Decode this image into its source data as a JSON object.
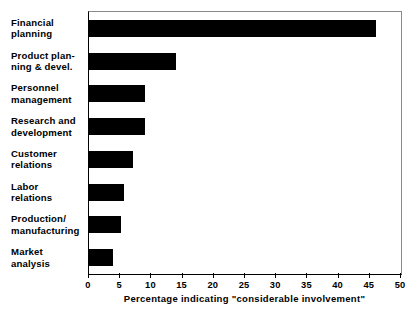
{
  "chart_data": {
    "type": "bar",
    "orientation": "horizontal",
    "title": "",
    "xlabel": "Percentage indicating \"considerable involvement\"",
    "ylabel": "",
    "xlim": [
      0,
      50
    ],
    "xticks": [
      0,
      5,
      10,
      15,
      20,
      25,
      30,
      35,
      40,
      45,
      50
    ],
    "xticklabels": [
      "0",
      "5",
      "10",
      "15",
      "20",
      "25",
      "30",
      "35",
      "40",
      "45",
      "50"
    ],
    "grid": false,
    "legend": null,
    "bar_color": "#000000",
    "background_color": "#ffffff",
    "categories": [
      "Financial\nplanning",
      "Product plan-\nning & devel.",
      "Personnel\nmanagement",
      "Research and\ndevelopment",
      "Customer\nrelations",
      "Labor\nrelations",
      "Production/\nmanufacturing",
      "Market\nanalysis"
    ],
    "values": [
      46,
      14,
      9,
      9,
      7,
      5.6,
      5.1,
      3.8
    ]
  }
}
